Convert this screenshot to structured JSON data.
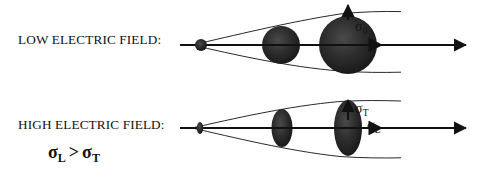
{
  "figure": {
    "type": "physics-schematic",
    "background_color": "#ffffff",
    "ink_color": "#111111",
    "width": 477,
    "height": 178
  },
  "rows": [
    {
      "id": "low-field",
      "label": "LOW ELECTRIC FIELD:",
      "axis": {
        "x_start": 180,
        "x_end": 466,
        "y": 45,
        "arrow": "right"
      },
      "envelope": {
        "tip_x": 192,
        "end_x": 401,
        "top_y_at_end": 12,
        "bottom_y_at_end": 72
      },
      "blobs": [
        {
          "cx": 201,
          "cy": 45,
          "rx": 6.0,
          "ry": 6.0
        },
        {
          "cx": 281,
          "cy": 45,
          "rx": 19.0,
          "ry": 19.0
        },
        {
          "cx": 348,
          "cy": 45,
          "rx": 29.0,
          "ry": 29.0
        }
      ],
      "arrows": [
        {
          "name": "sigma0-vertical",
          "direction": "up",
          "x": 348,
          "y_from": 18,
          "y_to": 5
        },
        {
          "name": "sigma0-horizontal",
          "direction": "right",
          "y": 45,
          "x_from": 348,
          "x_to": 384
        }
      ],
      "annotations": [
        {
          "name": "sigma0",
          "base": "σ",
          "sub": "0"
        }
      ]
    },
    {
      "id": "high-field",
      "label": "HIGH ELECTRIC FIELD:",
      "axis": {
        "x_start": 180,
        "x_end": 466,
        "y": 128,
        "arrow": "right"
      },
      "envelope": {
        "tip_x": 192,
        "end_x": 401,
        "top_y_at_end": 103,
        "bottom_y_at_end": 158
      },
      "blobs": [
        {
          "cx": 200,
          "cy": 128,
          "rx": 3.2,
          "ry": 6.0
        },
        {
          "cx": 282,
          "cy": 128,
          "rx": 10.5,
          "ry": 19.0
        },
        {
          "cx": 348,
          "cy": 128,
          "rx": 14.0,
          "ry": 28.0
        }
      ],
      "arrows": [
        {
          "name": "sigmaT-vertical",
          "direction": "up",
          "x": 348,
          "y_from": 118,
          "y_to": 100
        },
        {
          "name": "sigmaL-horizontal",
          "direction": "right",
          "y": 128,
          "x_from": 348,
          "x_to": 384
        }
      ],
      "annotations": [
        {
          "name": "sigmaT",
          "base": "σ",
          "sub": "T"
        },
        {
          "name": "sigmaL",
          "base": "σ",
          "sub": "L"
        }
      ]
    }
  ],
  "inequality": {
    "left_base": "σ",
    "left_sub": "L",
    "operator": ">",
    "right_base": "σ",
    "right_sub": "T"
  }
}
